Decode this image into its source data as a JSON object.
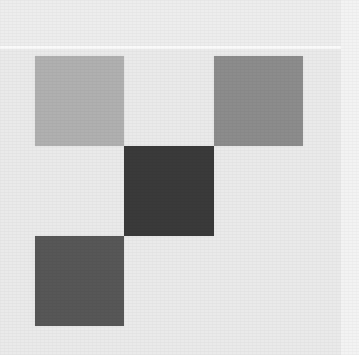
{
  "canvas": {
    "width": 359,
    "height": 355,
    "background_color": "#eaeaea",
    "top_band_color": "#ededed",
    "top_band_height": 46,
    "top_seam_color": "#fafafa",
    "right_band_color": "#f3f3f3",
    "right_band_width": 18,
    "description": "Abstract geometric composition: four gray squares in a pinwheel arrangement on a light gray ground"
  },
  "shapes": [
    {
      "name": "top-left-square",
      "label": "Light gray square",
      "x": 35,
      "y": 56,
      "width": 89,
      "height": 90,
      "color": "#b0b0b0"
    },
    {
      "name": "top-right-square",
      "label": "Medium gray square",
      "x": 214,
      "y": 56,
      "width": 89,
      "height": 90,
      "color": "#8c8c8c"
    },
    {
      "name": "center-square",
      "label": "Dark charcoal square",
      "x": 124,
      "y": 146,
      "width": 90,
      "height": 90,
      "color": "#3a3a3a"
    },
    {
      "name": "bottom-left-square",
      "label": "Dark gray square",
      "x": 35,
      "y": 236,
      "width": 89,
      "height": 90,
      "color": "#575757"
    }
  ]
}
